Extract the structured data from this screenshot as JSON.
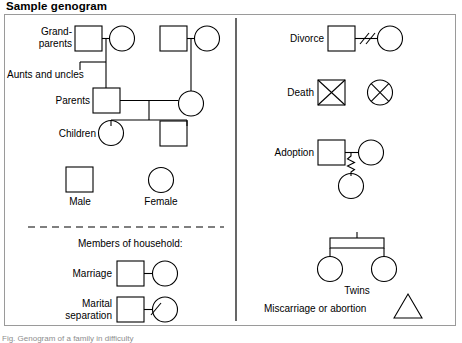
{
  "figure": {
    "title": "Sample genogram",
    "bottom_caption": "Fig. Genogram of a family in difficulty"
  },
  "left_panel": {
    "labels": {
      "grandparents_line1": "Grand-",
      "grandparents_line2": "parents",
      "aunts_uncles": "Aunts and uncles",
      "parents": "Parents",
      "children": "Children",
      "male": "Male",
      "female": "Female",
      "household": "Members of household:",
      "marriage": "Marriage",
      "marital_sep_line1": "Marital",
      "marital_sep_line2": "separation"
    }
  },
  "right_panel": {
    "labels": {
      "divorce": "Divorce",
      "death": "Death",
      "adoption": "Adoption",
      "twins": "Twins",
      "miscarriage": "Miscarriage or abortion"
    }
  },
  "legend_symbols": {
    "male": "square",
    "female": "circle",
    "death": "crossed-shape",
    "divorce": "double-slash",
    "marital_separation": "single-slash",
    "adoption": "zigzag-line",
    "twins": "shared-descent-bracket",
    "miscarriage": "triangle"
  },
  "style": {
    "stroke": "#000000",
    "frame_border": "#9a9a9a",
    "divider": "#000000",
    "background": "#ffffff"
  }
}
